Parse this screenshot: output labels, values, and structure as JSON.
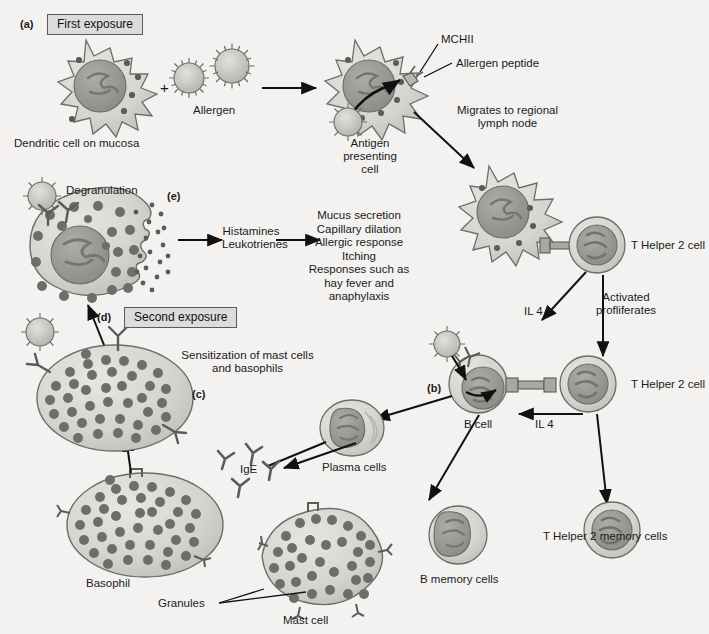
{
  "figure": {
    "background_color": "#f4f2f0",
    "ink_color": "#1a1a1a",
    "cell_fill": "#d9d7d3",
    "cell_stroke": "#6e6c68",
    "nucleus_fill": "#9d9b96",
    "granule_fill": "#6f6d69"
  },
  "panels": {
    "a": {
      "marker": "(a)",
      "box_label": "First exposure"
    },
    "b": {
      "marker": "(b)"
    },
    "c": {
      "marker": "(c)"
    },
    "d": {
      "marker": "(d)",
      "box_label": "Second exposure"
    },
    "e": {
      "marker": "(e)"
    }
  },
  "labels": {
    "dendritic_cell": "Dendritic cell on mucosa",
    "allergen": "Allergen",
    "plus_sign": "+",
    "mhcii": "MCHII",
    "allergen_peptide": "Allergen peptide",
    "antigen_presenting_cell": "Antigen\npresenting\ncell",
    "migrates": "Migrates to regional\nlymph node",
    "t_helper_2_cell_top": "T Helper 2 cell",
    "t_helper_2_cell_mid": "T Helper 2 cell",
    "il4_upper": "IL 4",
    "il4_lower": "IL 4",
    "activated_proliferates": "Activated\nprofliferates",
    "b_cell": "B cell",
    "plasma_cells": "Plasma cells",
    "b_memory_cells": "B memory cells",
    "t_helper_2_memory_cells": "T Helper 2 memory cells",
    "ige": "IgE",
    "sensitization": "Sensitization of mast cells\nand basophils",
    "basophil": "Basophil",
    "mast_cell": "Mast cell",
    "granules": "Granules",
    "degranulation": "Degranulation",
    "mediators": "Histamines\nLeukotrienes",
    "effects": "Mucus secretion\nCapillary dilation\nAllergic response\nItching\nResponses such as\nhay fever and\nanaphylaxis"
  }
}
